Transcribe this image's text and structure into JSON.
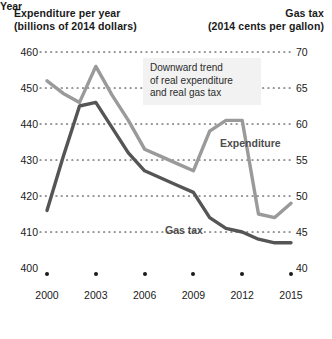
{
  "header": {
    "left_line1": "Expenditure per year",
    "left_line2": "(billions of 2014 dollars)",
    "right_line1": "Gas tax",
    "right_line2": "(2014 cents per gallon)"
  },
  "annotation": {
    "line1": "Downward trend",
    "line2": "of real expenditure",
    "line3": "and real gas tax"
  },
  "labels": {
    "expenditure": "Expenditure",
    "gas_tax": "Gas tax",
    "year_axis": "Year"
  },
  "colors": {
    "expenditure_line": "#9a9a9a",
    "gas_tax_line": "#555555",
    "gridline": "#333333",
    "annotation_bg": "#f2f2f2",
    "text": "#1a1a1a"
  },
  "chart_data": {
    "type": "line",
    "title": "",
    "xlabel": "Year",
    "grid": true,
    "legend": "inline-labels",
    "x_ticks": [
      2000,
      2003,
      2006,
      2009,
      2012,
      2015
    ],
    "x": [
      2000,
      2001,
      2002,
      2003,
      2004,
      2005,
      2006,
      2007,
      2008,
      2009,
      2010,
      2011,
      2012,
      2013,
      2014,
      2015
    ],
    "axes": [
      {
        "id": "left",
        "label": "Expenditure per year (billions of 2014 dollars)",
        "ylim": [
          400,
          460
        ],
        "ticks": [
          400,
          410,
          420,
          430,
          440,
          450,
          460
        ]
      },
      {
        "id": "right",
        "label": "Gas tax (2014 cents per gallon)",
        "ylim": [
          40,
          70
        ],
        "ticks": [
          40,
          45,
          50,
          55,
          60,
          65,
          70
        ]
      }
    ],
    "series": [
      {
        "name": "Expenditure",
        "axis": "left",
        "unit": "billions of 2014 dollars",
        "color": "#9a9a9a",
        "values": [
          452.0,
          448.5,
          446.0,
          456.0,
          448.0,
          441.0,
          433.0,
          431.0,
          429.0,
          427.0,
          438.0,
          441.0,
          441.0,
          415.0,
          414.0,
          418.0
        ]
      },
      {
        "name": "Gas tax",
        "axis": "right",
        "unit": "2014 cents per gallon",
        "color": "#555555",
        "values": [
          48.0,
          55.5,
          62.5,
          63.0,
          59.5,
          56.0,
          53.5,
          52.5,
          51.5,
          50.5,
          47.0,
          45.5,
          45.0,
          44.0,
          43.5,
          43.5
        ],
        "values_on_left_scale": [
          418.0,
          433.0,
          446.0,
          446.5,
          440.0,
          432.0,
          427.0,
          425.0,
          423.0,
          421.0,
          414.5,
          411.5,
          410.0,
          408.5,
          407.5,
          407.5
        ]
      }
    ]
  }
}
